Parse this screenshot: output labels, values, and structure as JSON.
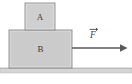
{
  "figure": {
    "background_color": "#ffffff"
  },
  "blocks": [
    {
      "id": "block-a",
      "label": "A",
      "position": "top",
      "fill_color": "#cfcfcf",
      "stroke_color": "#8f8f8f",
      "x": 25,
      "y": 3,
      "width": 30,
      "height": 27
    },
    {
      "id": "block-b",
      "label": "B",
      "position": "bottom",
      "fill_color": "#cbcbcb",
      "stroke_color": "#8f8f8f",
      "x": 9,
      "y": 30,
      "width": 63,
      "height": 38
    }
  ],
  "ground": {
    "label": "ground-surface",
    "fill_color": "#d5d5d5",
    "stroke_color": "#b4b4b4",
    "x": 0,
    "y": 68,
    "width": 132,
    "height": 5
  },
  "force_vector": {
    "label": "F",
    "has_vector_arrow": true,
    "direction": "right",
    "color": "#5a5a5a",
    "start_x": 72,
    "end_x": 126,
    "y": 48,
    "label_x": 93,
    "label_y": 35
  }
}
